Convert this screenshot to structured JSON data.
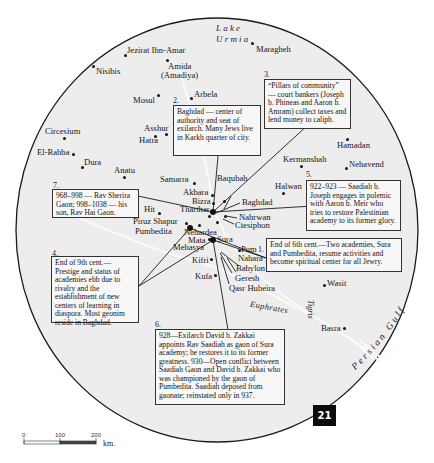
{
  "map": {
    "page_number": "21",
    "water_labels": {
      "lake": [
        "Lake",
        "Urmia"
      ],
      "euphrates": "Euphrates",
      "tigris": "Tigris",
      "persian_gulf": "Persian Gulf"
    },
    "places": [
      {
        "id": "jezirat",
        "name": "Jezirat Ibn-Amar"
      },
      {
        "id": "amida",
        "name": "Amida"
      },
      {
        "id": "amadiya",
        "name": "(Amadiya)"
      },
      {
        "id": "nisibis",
        "name": "Nisibis"
      },
      {
        "id": "maragheh",
        "name": "Maragheh"
      },
      {
        "id": "mosul",
        "name": "Mosul"
      },
      {
        "id": "arbela",
        "name": "Arbela"
      },
      {
        "id": "asshur",
        "name": "Asshur"
      },
      {
        "id": "hatra",
        "name": "Hatra"
      },
      {
        "id": "circesium",
        "name": "Circesium"
      },
      {
        "id": "elrahba",
        "name": "El-Rahba"
      },
      {
        "id": "dura",
        "name": "Dura"
      },
      {
        "id": "anatu",
        "name": "Anatu"
      },
      {
        "id": "hamadan",
        "name": "Hamadan"
      },
      {
        "id": "kermanshah",
        "name": "Kermanshah"
      },
      {
        "id": "nehavend",
        "name": "Nehavend"
      },
      {
        "id": "samarra",
        "name": "Samarra"
      },
      {
        "id": "baqubah",
        "name": "Baqubah"
      },
      {
        "id": "akbara",
        "name": "Akbara"
      },
      {
        "id": "bizra",
        "name": "Bizra"
      },
      {
        "id": "tharthar",
        "name": "Tharthar"
      },
      {
        "id": "baghdad",
        "name": "Baghdad"
      },
      {
        "id": "halwan",
        "name": "Halwan"
      },
      {
        "id": "hit",
        "name": "Hit"
      },
      {
        "id": "nahrwan",
        "name": "Nahrwan"
      },
      {
        "id": "ctesiphon",
        "name": "Ctesiphon"
      },
      {
        "id": "piruz",
        "name": "Piruz Shapur"
      },
      {
        "id": "pumbedita",
        "name": "Pumbedita"
      },
      {
        "id": "nehardea",
        "name": "Nehardea"
      },
      {
        "id": "mata",
        "name": "Mata"
      },
      {
        "id": "mehasya",
        "name": "Mehasya"
      },
      {
        "id": "sura",
        "name": "Sura"
      },
      {
        "id": "jahijan",
        "name": "Jahijan"
      },
      {
        "id": "pum",
        "name": "Pum"
      },
      {
        "id": "nahara",
        "name": "Nahara"
      },
      {
        "id": "babylon",
        "name": "Babylon"
      },
      {
        "id": "kifri",
        "name": "Kifri"
      },
      {
        "id": "kufa",
        "name": "Kufa"
      },
      {
        "id": "geresh",
        "name": "Geresh"
      },
      {
        "id": "qasr",
        "name": "Qasr Hubeira"
      },
      {
        "id": "wasit",
        "name": "Wasit"
      },
      {
        "id": "basra",
        "name": "Basra"
      }
    ],
    "notes": [
      {
        "number": "1.",
        "text": "End of 6th cent.—Two academies, Sura and Pumbedita, resume activities and become spiritual center for all Jewry."
      },
      {
        "number": "2.",
        "text": "Baghdad — center of authority and seat of exilarch. Many Jews live in Karkh quarter of city."
      },
      {
        "number": "3.",
        "text": "“Pillars of community” — court bankers (Joseph b. Phineas and Aaron b. Amram) collect taxes and lend money to caliph."
      },
      {
        "number": "4.",
        "text": "End of 9th cent.— Prestige and status of academies ebb due to rivalry and the establishment of new centers of learning in diaspora. Most geonim reside in Baghdad."
      },
      {
        "number": "5.",
        "text": "922–923 — Saadiah b. Joseph engages in polemic with Aaron b. Meir who tries to restore Palestinian academy to its former glory."
      },
      {
        "number": "6.",
        "text": "928—Exilarch David b. Zakkai appoints Rav Saadiah as gaon of Sura academy; he restores it to its former greatness. 930—Open conflict between Saadiah Gaon and David b. Zakkai who was championed by the gaon of Pumbedita. Saadiah deposed from gaonate; reinstated only in 937."
      },
      {
        "number": "7.",
        "text": "968–998 — Rav Sherira Gaon; 998–1038 — his son, Rav Hai Gaon."
      }
    ],
    "scale": {
      "ticks": [
        "0",
        "100",
        "200"
      ],
      "unit": "km."
    },
    "colors": {
      "map_fill": "#ededed",
      "border": "#1a1a1a",
      "badge": "#0c0c0c",
      "note_bg": "#f7f7f7"
    }
  }
}
